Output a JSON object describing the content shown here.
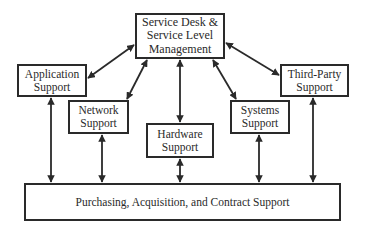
{
  "diagram": {
    "nodes": {
      "service_desk": "Service Desk &\nService Level\nManagement",
      "application": "Application\nSupport",
      "network": "Network\nSupport",
      "hardware": "Hardware\nSupport",
      "systems": "Systems\nSupport",
      "third_party": "Third-Party\nSupport",
      "purchasing": "Purchasing, Acquisition, and Contract Support"
    },
    "edges": [
      {
        "from": "service_desk",
        "to": "application",
        "type": "bidirectional"
      },
      {
        "from": "service_desk",
        "to": "network",
        "type": "bidirectional"
      },
      {
        "from": "service_desk",
        "to": "hardware",
        "type": "bidirectional"
      },
      {
        "from": "service_desk",
        "to": "systems",
        "type": "bidirectional"
      },
      {
        "from": "service_desk",
        "to": "third_party",
        "type": "bidirectional"
      },
      {
        "from": "application",
        "to": "purchasing",
        "type": "bidirectional"
      },
      {
        "from": "network",
        "to": "purchasing",
        "type": "bidirectional"
      },
      {
        "from": "hardware",
        "to": "purchasing",
        "type": "bidirectional"
      },
      {
        "from": "systems",
        "to": "purchasing",
        "type": "bidirectional"
      },
      {
        "from": "third_party",
        "to": "purchasing",
        "type": "bidirectional"
      }
    ],
    "colors": {
      "line": "#2a2a2a",
      "background": "#ffffff"
    }
  }
}
